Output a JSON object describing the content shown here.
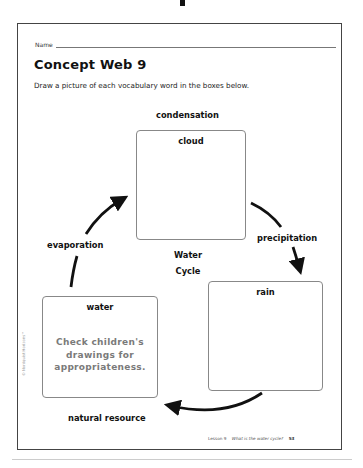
{
  "header": {
    "name_label": "Name"
  },
  "title": "Concept Web 9",
  "instructions": "Draw a picture of each vocabulary word in the boxes below.",
  "center": {
    "line1": "Water",
    "line2": "Cycle"
  },
  "boxes": [
    {
      "label": "cloud",
      "vocabulary": "condensation",
      "answer": ""
    },
    {
      "label": "rain",
      "vocabulary": "precipitation",
      "answer": ""
    },
    {
      "label": "water",
      "vocabulary": "natural resource",
      "answer_lines": [
        "Check children's",
        "drawings for",
        "appropriateness."
      ]
    }
  ],
  "arrow_labels": {
    "top": "condensation",
    "right": "precipitation",
    "bottom": "natural resource",
    "left": "evaporation"
  },
  "footer": {
    "lesson": "Lesson 9",
    "topic": "What is the water cycle?",
    "page": "53"
  },
  "copyright": "© Nordquist Horizons™",
  "colors": {
    "ink": "#111111",
    "answer_gray": "#7a7a7a",
    "box_border": "#888888"
  }
}
